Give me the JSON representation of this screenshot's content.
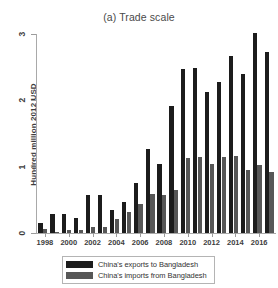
{
  "figure": {
    "panel_label": "(a)",
    "title": "(a) Trade scale"
  },
  "axes": {
    "ylabel": "Hundred million 2012 USD",
    "xlabel": "",
    "y_ticks": [
      "0",
      "1",
      "2",
      "3"
    ],
    "x_ticks": [
      "1998",
      "2000",
      "2002",
      "2004",
      "2006",
      "2008",
      "2010",
      "2012",
      "2014",
      "2016"
    ]
  },
  "legend": {
    "entries": [
      {
        "label": "China's exports to Bangladesh",
        "color": "#1c1c1c",
        "key": "exports"
      },
      {
        "label": "China's imports from Bangladesh",
        "color": "#575757",
        "key": "imports"
      }
    ]
  },
  "colors": {
    "exports": "#1c1c1c",
    "imports": "#575757",
    "axis": "#a9a9a9",
    "text": "#3d3d3d",
    "background": "#ffffff"
  },
  "chart_data": {
    "type": "bar",
    "title": "(a) Trade scale",
    "xlabel": "",
    "ylabel": "Hundred million 2012 USD",
    "ylim": [
      0,
      3
    ],
    "yticks": [
      0,
      1,
      2,
      3
    ],
    "grid": false,
    "legend_position": "bottom",
    "categories": [
      "1998",
      "1999",
      "2000",
      "2001",
      "2002",
      "2003",
      "2004",
      "2005",
      "2006",
      "2007",
      "2008",
      "2009",
      "2010",
      "2011",
      "2012",
      "2013",
      "2014",
      "2015",
      "2016",
      "2017"
    ],
    "xtick_labels": [
      "1998",
      "2000",
      "2002",
      "2004",
      "2006",
      "2008",
      "2010",
      "2012",
      "2014",
      "2016"
    ],
    "series": [
      {
        "name": "China's exports to Bangladesh",
        "color": "#1c1c1c",
        "values": [
          0.15,
          0.29,
          0.29,
          0.22,
          0.58,
          0.57,
          0.35,
          0.47,
          0.76,
          1.27,
          1.04,
          1.92,
          2.47,
          2.49,
          2.12,
          2.28,
          2.67,
          2.4,
          3.02,
          2.73
        ]
      },
      {
        "name": "China's imports from Bangladesh",
        "color": "#575757",
        "values": [
          0.06,
          0.02,
          0.04,
          0.04,
          0.09,
          0.09,
          0.21,
          0.32,
          0.44,
          0.59,
          0.57,
          0.65,
          1.13,
          1.15,
          1.04,
          1.15,
          1.16,
          0.95,
          1.02,
          0.92
        ]
      }
    ]
  }
}
